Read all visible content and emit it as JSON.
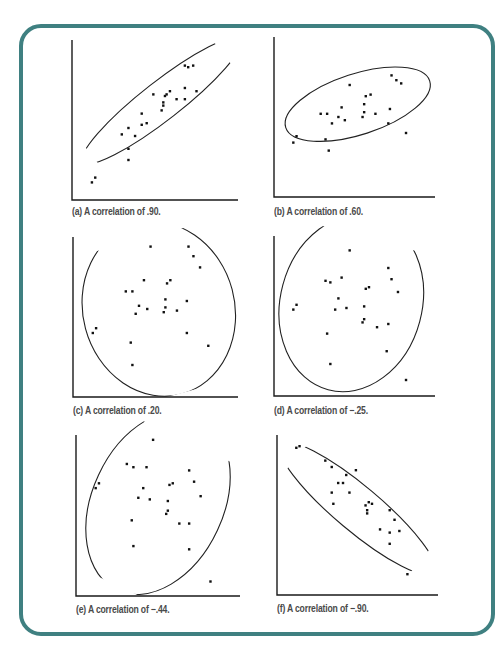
{
  "figure": {
    "frame_color": "#3f8081",
    "panels": [
      {
        "id": "a",
        "caption": "(a) A correlation of .90."
      },
      {
        "id": "b",
        "caption": "(b) A correlation of .60."
      },
      {
        "id": "c",
        "caption": "(c) A correlation of .20."
      },
      {
        "id": "d",
        "caption": "(d) A correlation of −.25."
      },
      {
        "id": "e",
        "caption": "(e) A correlation of −.44."
      },
      {
        "id": "f",
        "caption": "(f) A correlation of −.90."
      }
    ]
  },
  "chart_data": [
    {
      "type": "scatter",
      "title": "(a) A correlation of .90.",
      "r": 0.9,
      "xlabel": "",
      "ylabel": "",
      "grid": false,
      "ellipse": {
        "cx": 0.54,
        "cy": 0.62,
        "rx": 0.6,
        "ry": 0.12,
        "angle": -38
      },
      "points": [
        [
          0.12,
          0.11
        ],
        [
          0.14,
          0.14
        ],
        [
          0.34,
          0.25
        ],
        [
          0.34,
          0.32
        ],
        [
          0.3,
          0.41
        ],
        [
          0.34,
          0.45
        ],
        [
          0.38,
          0.4
        ],
        [
          0.42,
          0.47
        ],
        [
          0.42,
          0.54
        ],
        [
          0.45,
          0.48
        ],
        [
          0.49,
          0.66
        ],
        [
          0.54,
          0.56
        ],
        [
          0.55,
          0.59
        ],
        [
          0.55,
          0.61
        ],
        [
          0.56,
          0.65
        ],
        [
          0.57,
          0.66
        ],
        [
          0.59,
          0.68
        ],
        [
          0.63,
          0.63
        ],
        [
          0.68,
          0.63
        ],
        [
          0.68,
          0.7
        ],
        [
          0.68,
          0.84
        ],
        [
          0.7,
          0.83
        ],
        [
          0.73,
          0.84
        ],
        [
          0.75,
          0.68
        ]
      ]
    },
    {
      "type": "scatter",
      "title": "(b) A correlation of .60.",
      "r": 0.6,
      "xlabel": "",
      "ylabel": "",
      "grid": false,
      "ellipse": {
        "cx": 0.52,
        "cy": 0.58,
        "rx": 0.47,
        "ry": 0.19,
        "angle": -18
      },
      "points": [
        [
          0.12,
          0.34
        ],
        [
          0.14,
          0.38
        ],
        [
          0.29,
          0.52
        ],
        [
          0.33,
          0.52
        ],
        [
          0.32,
          0.36
        ],
        [
          0.34,
          0.29
        ],
        [
          0.36,
          0.46
        ],
        [
          0.4,
          0.5
        ],
        [
          0.42,
          0.56
        ],
        [
          0.44,
          0.48
        ],
        [
          0.47,
          0.7
        ],
        [
          0.55,
          0.5
        ],
        [
          0.56,
          0.53
        ],
        [
          0.56,
          0.58
        ],
        [
          0.57,
          0.63
        ],
        [
          0.6,
          0.64
        ],
        [
          0.63,
          0.52
        ],
        [
          0.71,
          0.46
        ],
        [
          0.72,
          0.55
        ],
        [
          0.73,
          0.76
        ],
        [
          0.76,
          0.73
        ],
        [
          0.79,
          0.71
        ],
        [
          0.82,
          0.4
        ]
      ]
    },
    {
      "type": "scatter",
      "title": "(c) A correlation of .20.",
      "r": 0.2,
      "xlabel": "",
      "ylabel": "",
      "grid": false,
      "ellipse": {
        "cx": 0.52,
        "cy": 0.55,
        "rx": 0.46,
        "ry": 0.55,
        "angle": -15
      },
      "points": [
        [
          0.12,
          0.4
        ],
        [
          0.14,
          0.43
        ],
        [
          0.32,
          0.66
        ],
        [
          0.36,
          0.66
        ],
        [
          0.35,
          0.34
        ],
        [
          0.36,
          0.2
        ],
        [
          0.4,
          0.57
        ],
        [
          0.38,
          0.52
        ],
        [
          0.43,
          0.73
        ],
        [
          0.45,
          0.55
        ],
        [
          0.47,
          0.94
        ],
        [
          0.55,
          0.53
        ],
        [
          0.56,
          0.56
        ],
        [
          0.56,
          0.61
        ],
        [
          0.57,
          0.71
        ],
        [
          0.59,
          0.73
        ],
        [
          0.63,
          0.54
        ],
        [
          0.69,
          0.4
        ],
        [
          0.69,
          0.6
        ],
        [
          0.7,
          0.94
        ],
        [
          0.73,
          0.88
        ],
        [
          0.77,
          0.81
        ],
        [
          0.82,
          0.32
        ]
      ]
    },
    {
      "type": "scatter",
      "title": "(d) A correlation of −.25.",
      "r": -0.25,
      "xlabel": "",
      "ylabel": "",
      "grid": false,
      "ellipse": {
        "cx": 0.48,
        "cy": 0.58,
        "rx": 0.44,
        "ry": 0.56,
        "angle": 15
      },
      "points": [
        [
          0.12,
          0.54
        ],
        [
          0.14,
          0.57
        ],
        [
          0.32,
          0.72
        ],
        [
          0.35,
          0.71
        ],
        [
          0.33,
          0.39
        ],
        [
          0.35,
          0.2
        ],
        [
          0.38,
          0.54
        ],
        [
          0.4,
          0.61
        ],
        [
          0.42,
          0.74
        ],
        [
          0.45,
          0.55
        ],
        [
          0.47,
          0.91
        ],
        [
          0.55,
          0.46
        ],
        [
          0.56,
          0.48
        ],
        [
          0.56,
          0.56
        ],
        [
          0.57,
          0.67
        ],
        [
          0.59,
          0.68
        ],
        [
          0.64,
          0.43
        ],
        [
          0.7,
          0.28
        ],
        [
          0.71,
          0.45
        ],
        [
          0.71,
          0.8
        ],
        [
          0.73,
          0.73
        ],
        [
          0.77,
          0.65
        ],
        [
          0.82,
          0.1
        ]
      ]
    },
    {
      "type": "scatter",
      "title": "(e) A correlation of −.44.",
      "r": -0.44,
      "xlabel": "",
      "ylabel": "",
      "grid": false,
      "ellipse": {
        "cx": 0.5,
        "cy": 0.58,
        "rx": 0.4,
        "ry": 0.6,
        "angle": 25
      },
      "points": [
        [
          0.12,
          0.67
        ],
        [
          0.14,
          0.7
        ],
        [
          0.31,
          0.82
        ],
        [
          0.35,
          0.8
        ],
        [
          0.34,
          0.47
        ],
        [
          0.35,
          0.31
        ],
        [
          0.38,
          0.61
        ],
        [
          0.41,
          0.67
        ],
        [
          0.43,
          0.8
        ],
        [
          0.45,
          0.6
        ],
        [
          0.47,
          0.97
        ],
        [
          0.55,
          0.51
        ],
        [
          0.56,
          0.53
        ],
        [
          0.56,
          0.59
        ],
        [
          0.57,
          0.69
        ],
        [
          0.59,
          0.7
        ],
        [
          0.63,
          0.45
        ],
        [
          0.69,
          0.29
        ],
        [
          0.69,
          0.45
        ],
        [
          0.69,
          0.78
        ],
        [
          0.72,
          0.71
        ],
        [
          0.76,
          0.62
        ],
        [
          0.82,
          0.09
        ]
      ]
    },
    {
      "type": "scatter",
      "title": "(f) A correlation of −.90.",
      "r": -0.9,
      "xlabel": "",
      "ylabel": "",
      "grid": false,
      "ellipse": {
        "cx": 0.5,
        "cy": 0.54,
        "rx": 0.62,
        "ry": 0.14,
        "angle": 40
      },
      "points": [
        [
          0.12,
          0.92
        ],
        [
          0.14,
          0.93
        ],
        [
          0.3,
          0.84
        ],
        [
          0.34,
          0.8
        ],
        [
          0.34,
          0.64
        ],
        [
          0.35,
          0.57
        ],
        [
          0.38,
          0.7
        ],
        [
          0.41,
          0.7
        ],
        [
          0.43,
          0.75
        ],
        [
          0.45,
          0.64
        ],
        [
          0.49,
          0.78
        ],
        [
          0.55,
          0.56
        ],
        [
          0.56,
          0.51
        ],
        [
          0.56,
          0.53
        ],
        [
          0.57,
          0.58
        ],
        [
          0.59,
          0.57
        ],
        [
          0.64,
          0.41
        ],
        [
          0.7,
          0.32
        ],
        [
          0.7,
          0.39
        ],
        [
          0.7,
          0.53
        ],
        [
          0.73,
          0.47
        ],
        [
          0.76,
          0.4
        ],
        [
          0.81,
          0.13
        ]
      ]
    }
  ]
}
